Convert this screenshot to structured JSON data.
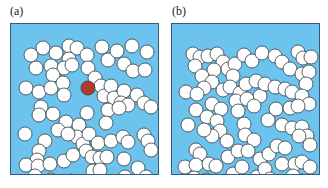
{
  "panels": [
    {
      "label": "(a)",
      "description": "Random disks with a highlighted (red) central disk and its connected cluster"
    },
    {
      "label": "(b)",
      "description": "Higher density of random disks forming spanning clusters"
    }
  ],
  "colors": {
    "background": "#6cc4ee",
    "disk": "#ffffff",
    "disk_outline": "#2e3a44",
    "highlight": "#b03a26",
    "border": "#3a5a78"
  },
  "disk_radius": 7,
  "panel_a_disks": [
    [
      20,
      31
    ],
    [
      32,
      24
    ],
    [
      45,
      29
    ],
    [
      58,
      22
    ],
    [
      66,
      24
    ],
    [
      58,
      35
    ],
    [
      40,
      42
    ],
    [
      25,
      44
    ],
    [
      53,
      44
    ],
    [
      61,
      41
    ],
    [
      76,
      31
    ],
    [
      91,
      23
    ],
    [
      97,
      36
    ],
    [
      106,
      27
    ],
    [
      121,
      22
    ],
    [
      136,
      28
    ],
    [
      113,
      40
    ],
    [
      122,
      47
    ],
    [
      134,
      46
    ],
    [
      15,
      64
    ],
    [
      28,
      68
    ],
    [
      42,
      51
    ],
    [
      40,
      64
    ],
    [
      52,
      59
    ],
    [
      53,
      71
    ],
    [
      77,
      44
    ],
    [
      84,
      54
    ],
    [
      90,
      62
    ],
    [
      93,
      72
    ],
    [
      100,
      62
    ],
    [
      103,
      74
    ],
    [
      113,
      67
    ],
    [
      110,
      79
    ],
    [
      117,
      81
    ],
    [
      126,
      71
    ],
    [
      133,
      79
    ],
    [
      140,
      83
    ],
    [
      97,
      86
    ],
    [
      108,
      84
    ],
    [
      30,
      83
    ],
    [
      28,
      91
    ],
    [
      42,
      90
    ],
    [
      55,
      98
    ],
    [
      76,
      89
    ],
    [
      68,
      101
    ],
    [
      66,
      113
    ],
    [
      72,
      120
    ],
    [
      75,
      127
    ],
    [
      78,
      110
    ],
    [
      87,
      119
    ],
    [
      95,
      99
    ],
    [
      14,
      110
    ],
    [
      34,
      117
    ],
    [
      47,
      106
    ],
    [
      57,
      110
    ],
    [
      100,
      117
    ],
    [
      112,
      113
    ],
    [
      117,
      118
    ],
    [
      133,
      111
    ],
    [
      137,
      117
    ],
    [
      140,
      126
    ],
    [
      28,
      127
    ],
    [
      26,
      136
    ],
    [
      15,
      141
    ],
    [
      27,
      142
    ],
    [
      39,
      140
    ],
    [
      53,
      137
    ],
    [
      62,
      131
    ],
    [
      81,
      133
    ],
    [
      89,
      134
    ],
    [
      96,
      133
    ],
    [
      82,
      147
    ],
    [
      89,
      146
    ],
    [
      82,
      159
    ],
    [
      113,
      135
    ],
    [
      114,
      153
    ],
    [
      127,
      144
    ],
    [
      135,
      153
    ],
    [
      106,
      167
    ],
    [
      140,
      163
    ],
    [
      84,
      166
    ],
    [
      72,
      163
    ],
    [
      24,
      152
    ],
    [
      32,
      160
    ],
    [
      40,
      156
    ],
    [
      25,
      167
    ],
    [
      60,
      157
    ]
  ],
  "panel_a_highlight": [
    87,
    87
  ],
  "panel_b_disks": [
    [
      21,
      30
    ],
    [
      28,
      33
    ],
    [
      23,
      42
    ],
    [
      36,
      32
    ],
    [
      45,
      30
    ],
    [
      51,
      38
    ],
    [
      42,
      46
    ],
    [
      56,
      45
    ],
    [
      63,
      40
    ],
    [
      72,
      31
    ],
    [
      80,
      37
    ],
    [
      90,
      29
    ],
    [
      103,
      32
    ],
    [
      110,
      38
    ],
    [
      126,
      28
    ],
    [
      131,
      34
    ],
    [
      139,
      33
    ],
    [
      118,
      45
    ],
    [
      130,
      50
    ],
    [
      137,
      48
    ],
    [
      30,
      52
    ],
    [
      40,
      58
    ],
    [
      32,
      64
    ],
    [
      14,
      68
    ],
    [
      25,
      70
    ],
    [
      51,
      66
    ],
    [
      61,
      52
    ],
    [
      58,
      63
    ],
    [
      68,
      69
    ],
    [
      74,
      60
    ],
    [
      84,
      57
    ],
    [
      88,
      72
    ],
    [
      93,
      60
    ],
    [
      103,
      63
    ],
    [
      113,
      65
    ],
    [
      120,
      68
    ],
    [
      134,
      60
    ],
    [
      130,
      72
    ],
    [
      137,
      80
    ],
    [
      16,
      101
    ],
    [
      24,
      86
    ],
    [
      40,
      80
    ],
    [
      35,
      93
    ],
    [
      49,
      85
    ],
    [
      45,
      97
    ],
    [
      64,
      77
    ],
    [
      66,
      87
    ],
    [
      75,
      75
    ],
    [
      82,
      82
    ],
    [
      72,
      100
    ],
    [
      73,
      111
    ],
    [
      82,
      116
    ],
    [
      96,
      96
    ],
    [
      104,
      85
    ],
    [
      118,
      84
    ],
    [
      126,
      82
    ],
    [
      110,
      101
    ],
    [
      120,
      104
    ],
    [
      130,
      103
    ],
    [
      135,
      112
    ],
    [
      138,
      121
    ],
    [
      48,
      107
    ],
    [
      40,
      112
    ],
    [
      55,
      117
    ],
    [
      32,
      106
    ],
    [
      24,
      126
    ],
    [
      28,
      130
    ],
    [
      13,
      143
    ],
    [
      24,
      141
    ],
    [
      37,
      140
    ],
    [
      44,
      142
    ],
    [
      56,
      133
    ],
    [
      66,
      127
    ],
    [
      76,
      127
    ],
    [
      88,
      135
    ],
    [
      97,
      130
    ],
    [
      105,
      122
    ],
    [
      113,
      124
    ],
    [
      110,
      140
    ],
    [
      123,
      140
    ],
    [
      130,
      138
    ],
    [
      61,
      150
    ],
    [
      70,
      143
    ],
    [
      85,
      153
    ],
    [
      93,
      145
    ],
    [
      98,
      155
    ],
    [
      121,
      152
    ],
    [
      130,
      157
    ],
    [
      139,
      160
    ],
    [
      138,
      143
    ],
    [
      22,
      154
    ],
    [
      34,
      156
    ],
    [
      29,
      166
    ],
    [
      42,
      168
    ],
    [
      55,
      163
    ],
    [
      64,
      168
    ],
    [
      75,
      165
    ],
    [
      113,
      171
    ],
    [
      88,
      168
    ],
    [
      102,
      165
    ],
    [
      130,
      168
    ],
    [
      127,
      112
    ]
  ]
}
